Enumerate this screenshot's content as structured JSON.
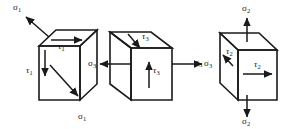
{
  "figure": {
    "background_color": "#ffffff",
    "stroke_color": "#1a1a1a",
    "width": 294,
    "height": 129
  },
  "symbols": {
    "sigma": "σ",
    "tau": "τ"
  },
  "cubes": [
    {
      "id": "cube-1",
      "name": "left-cube",
      "labels": [
        {
          "key": "c1_sigma_top",
          "symbol": "σ",
          "subscript": "1",
          "text": "σ1",
          "role": "normal-stress",
          "position": "top-left-outward"
        },
        {
          "key": "c1_tau_top",
          "symbol": "τ",
          "subscript": "1",
          "text": "τ1",
          "role": "shear-stress",
          "position": "top-face"
        },
        {
          "key": "c1_tau_left",
          "symbol": "τ",
          "subscript": "1",
          "text": "τ1",
          "role": "shear-stress",
          "position": "left-face"
        },
        {
          "key": "c1_sigma_bottom",
          "symbol": "σ",
          "subscript": "1",
          "text": "σ1",
          "role": "normal-stress",
          "position": "bottom-right-outward"
        }
      ],
      "arrows": [
        {
          "key": "c1_arrow_sigma_top",
          "direction": "up-left",
          "of": "c1_sigma_top"
        },
        {
          "key": "c1_arrow_tau_top",
          "direction": "right",
          "of": "c1_tau_top"
        },
        {
          "key": "c1_arrow_tau_left",
          "direction": "down",
          "of": "c1_tau_left"
        },
        {
          "key": "c1_arrow_sigma_bottom",
          "direction": "down-right",
          "of": "c1_sigma_bottom"
        }
      ]
    },
    {
      "id": "cube-2",
      "name": "middle-cube",
      "labels": [
        {
          "key": "c2_tau_top",
          "symbol": "τ",
          "subscript": "3",
          "text": "τ3",
          "role": "shear-stress",
          "position": "top-face"
        },
        {
          "key": "c2_sigma_left",
          "symbol": "σ",
          "subscript": "3",
          "text": "σ3",
          "role": "normal-stress",
          "position": "left-outward"
        },
        {
          "key": "c2_tau_front",
          "symbol": "τ",
          "subscript": "3",
          "text": "τ3",
          "role": "shear-stress",
          "position": "front-face"
        },
        {
          "key": "c2_sigma_right",
          "symbol": "σ",
          "subscript": "3",
          "text": "σ3",
          "role": "normal-stress",
          "position": "right-outward"
        }
      ],
      "arrows": [
        {
          "key": "c2_arrow_tau_top",
          "direction": "down-left",
          "of": "c2_tau_top"
        },
        {
          "key": "c2_arrow_sigma_left",
          "direction": "left",
          "of": "c2_sigma_left"
        },
        {
          "key": "c2_arrow_tau_front",
          "direction": "up",
          "of": "c2_tau_front"
        },
        {
          "key": "c2_arrow_sigma_right",
          "direction": "right",
          "of": "c2_sigma_right"
        }
      ]
    },
    {
      "id": "cube-3",
      "name": "right-cube",
      "labels": [
        {
          "key": "c3_sigma_top",
          "symbol": "σ",
          "subscript": "2",
          "text": "σ2",
          "role": "normal-stress",
          "position": "top-outward"
        },
        {
          "key": "c3_sigma_left",
          "symbol": "σ",
          "subscript": "3",
          "text": "σ3",
          "role": "normal-stress",
          "position": "left-outside"
        },
        {
          "key": "c3_tau_left",
          "symbol": "τ",
          "subscript": "2",
          "text": "τ2",
          "role": "shear-stress",
          "position": "left-face"
        },
        {
          "key": "c3_tau_front",
          "symbol": "τ",
          "subscript": "2",
          "text": "τ2",
          "role": "shear-stress",
          "position": "front-face"
        },
        {
          "key": "c3_sigma_bottom",
          "symbol": "σ",
          "subscript": "2",
          "text": "σ2",
          "role": "normal-stress",
          "position": "bottom-outward"
        }
      ],
      "arrows": [
        {
          "key": "c3_arrow_sigma_top",
          "direction": "up",
          "of": "c3_sigma_top"
        },
        {
          "key": "c3_arrow_tau_left",
          "direction": "up-left",
          "of": "c3_tau_left"
        },
        {
          "key": "c3_arrow_tau_front",
          "direction": "right",
          "of": "c3_tau_front"
        },
        {
          "key": "c3_arrow_sigma_bottom",
          "direction": "down",
          "of": "c3_sigma_bottom"
        }
      ]
    }
  ]
}
